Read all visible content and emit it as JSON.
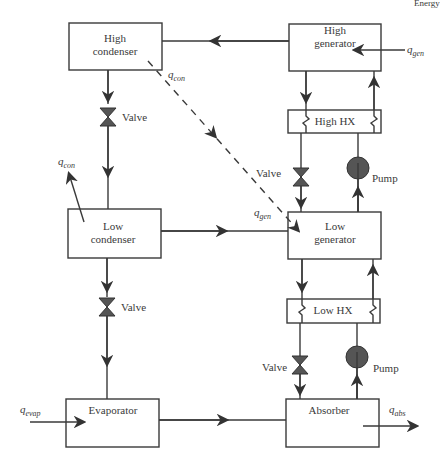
{
  "diagram": {
    "corner_text": "Energy",
    "components": {
      "high_condenser": {
        "line1": "High",
        "line2": "condenser"
      },
      "high_generator": {
        "line1": "High",
        "line2": "generator"
      },
      "high_hx": {
        "label": "High HX"
      },
      "low_condenser": {
        "line1": "Low",
        "line2": "condenser"
      },
      "low_generator": {
        "line1": "Low",
        "line2": "generator"
      },
      "low_hx": {
        "label": "Low HX"
      },
      "evaporator": {
        "label": "Evaporator"
      },
      "absorber": {
        "label": "Absorber"
      }
    },
    "valves": {
      "left_upper": "Valve",
      "left_lower": "Valve",
      "right_upper": "Valve",
      "right_lower": "Valve"
    },
    "pumps": {
      "upper": "Pump",
      "lower": "Pump"
    },
    "heat_flows": {
      "q_con_high": {
        "base": "q",
        "sub": "con"
      },
      "q_con_low": {
        "base": "q",
        "sub": "con"
      },
      "q_gen_high": {
        "base": "q",
        "sub": "gen"
      },
      "q_gen_low": {
        "base": "q",
        "sub": "gen"
      },
      "q_evap": {
        "base": "q",
        "sub": "evap"
      },
      "q_abs": {
        "base": "q",
        "sub": "abs"
      }
    },
    "colors": {
      "line": "#3a3a3a",
      "valve_fill": "#555555",
      "pump_fill": "#555555",
      "background": "#ffffff"
    }
  }
}
